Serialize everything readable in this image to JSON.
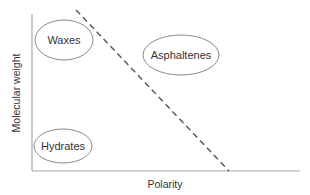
{
  "diagram": {
    "x_axis_label": "Polarity",
    "y_axis_label": "Molecular weight",
    "regions": [
      {
        "label": "Waxes"
      },
      {
        "label": "Asphaltenes"
      },
      {
        "label": "Hydrates"
      }
    ],
    "colors": {
      "axis": "#a0a0a0",
      "ellipse": "#8a8a8a",
      "dashed_line": "#555555",
      "text": "#333333"
    }
  }
}
